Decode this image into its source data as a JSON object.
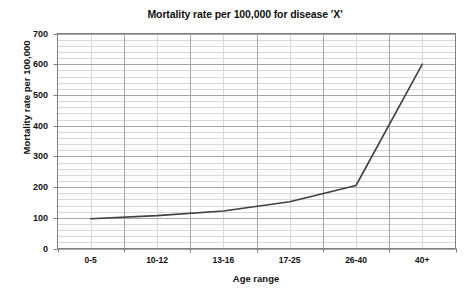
{
  "chart_data": {
    "type": "line",
    "title": "Mortality rate per 100,000 for disease 'X'",
    "xlabel": "Age range",
    "ylabel": "Mortality rate per 100,000",
    "categories": [
      "0-5",
      "10-12",
      "13-16",
      "17-25",
      "26-40",
      "40+"
    ],
    "values": [
      97,
      107,
      122,
      152,
      205,
      600
    ],
    "series": [
      {
        "name": "Mortality rate",
        "values": [
          97,
          107,
          122,
          152,
          205,
          600
        ]
      }
    ],
    "ylim": [
      0,
      700
    ],
    "ytick_labels": [
      "0",
      "100",
      "200",
      "300",
      "400",
      "500",
      "600",
      "700"
    ],
    "ytick_values": [
      0,
      100,
      200,
      300,
      400,
      500,
      600,
      700
    ],
    "y_major_step": 100,
    "y_minor_step": 20,
    "grid": "both",
    "legend": "none",
    "line_color": "#404040",
    "grid_major_color": "#a6a6a6",
    "grid_minor_color": "#d9d9d9",
    "axis_color": "#808080",
    "plot_background": "#ffffff"
  }
}
